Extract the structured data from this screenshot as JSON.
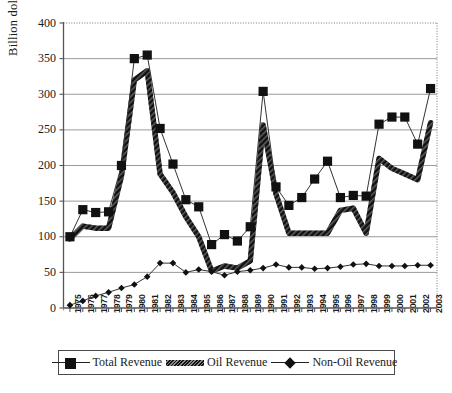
{
  "chart_data": {
    "type": "line",
    "title": "",
    "xlabel": "",
    "ylabel": "Billion dollar",
    "ylim": [
      0,
      400
    ],
    "ytick_step": 50,
    "yticks": [
      "0",
      "50",
      "100",
      "150",
      "200",
      "250",
      "300",
      "350",
      "400"
    ],
    "grid": "horizontal-solid-gray",
    "legend_position": "bottom",
    "categories": [
      "1975",
      "1976",
      "1977",
      "1978",
      "1979",
      "1980",
      "1981",
      "1982",
      "1983",
      "1984",
      "1985",
      "1986",
      "1987",
      "1988",
      "1989",
      "1990",
      "1991",
      "1992",
      "1993",
      "1994",
      "1995",
      "1996",
      "1997",
      "1998",
      "1999",
      "2000",
      "2001",
      "2002",
      "2003"
    ],
    "series": [
      {
        "name": "Total Revenue",
        "marker": "square",
        "values": [
          100,
          138,
          134,
          135,
          200,
          350,
          355,
          252,
          202,
          152,
          142,
          89,
          103,
          94,
          114,
          304,
          170,
          144,
          155,
          181,
          206,
          155,
          158,
          157,
          258,
          268,
          268,
          230,
          308
        ]
      },
      {
        "name": "Oil Revenue",
        "marker": "none",
        "values": [
          97,
          115,
          112,
          112,
          185,
          320,
          333,
          188,
          162,
          128,
          100,
          52,
          59,
          56,
          66,
          257,
          160,
          105,
          105,
          105,
          105,
          137,
          140,
          105,
          210,
          196,
          188,
          180,
          260
        ]
      },
      {
        "name": "Non-Oil Revenue",
        "marker": "diamond",
        "values": [
          4,
          10,
          17,
          22,
          28,
          33,
          44,
          63,
          63,
          50,
          54,
          51,
          46,
          51,
          53,
          56,
          61,
          57,
          57,
          55,
          56,
          58,
          61,
          62,
          59,
          59,
          59,
          60,
          60
        ]
      }
    ]
  },
  "legend": {
    "entries": [
      {
        "label": "Total Revenue",
        "icon": "line-square-marker-icon"
      },
      {
        "label": "Oil Revenue",
        "icon": "thick-hatched-line-icon"
      },
      {
        "label": "Non-Oil Revenue",
        "icon": "line-diamond-marker-icon"
      }
    ]
  }
}
